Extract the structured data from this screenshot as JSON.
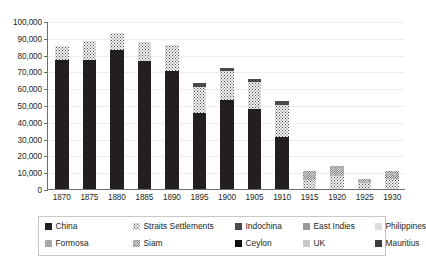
{
  "chart_data": {
    "type": "bar",
    "stacked": true,
    "title": "",
    "subtitle": "",
    "xlabel": "",
    "ylabel": "",
    "ylim": [
      0,
      100000
    ],
    "ytick_values": [
      0,
      10000,
      20000,
      30000,
      40000,
      50000,
      60000,
      70000,
      80000,
      90000,
      100000
    ],
    "ytick_labels": [
      "0",
      "10,000",
      "20,000",
      "30,000",
      "40,000",
      "50,000",
      "60,000",
      "70,000",
      "80,000",
      "90,000",
      "100,000"
    ],
    "grid": true,
    "grid_axis": "y",
    "legend_position": "bottom",
    "categories": [
      "1870",
      "1875",
      "1880",
      "1885",
      "1890",
      "1895",
      "1900",
      "1905",
      "1910",
      "1915",
      "1920",
      "1925",
      "1930"
    ],
    "series": [
      {
        "name": "China",
        "pattern": "solid-black",
        "color": "#231f20",
        "values": [
          77000,
          77000,
          83000,
          76000,
          70500,
          45000,
          53000,
          47500,
          31000,
          0,
          0,
          0,
          0
        ]
      },
      {
        "name": "Straits Settlements",
        "pattern": "light-stipple",
        "color": "#f4f4f4",
        "values": [
          8000,
          11000,
          10000,
          11500,
          15000,
          16000,
          17000,
          16000,
          19000,
          5500,
          7500,
          3500,
          6000
        ]
      },
      {
        "name": "Indochina",
        "pattern": "solid-dark-gray",
        "color": "#4a4a4a",
        "values": [
          0,
          0,
          0,
          0,
          0,
          2000,
          2000,
          2000,
          2500,
          0,
          0,
          0,
          0
        ]
      },
      {
        "name": "East Indies",
        "pattern": "solid-mid-gray",
        "color": "#9a9a9a",
        "values": [
          0,
          0,
          0,
          0,
          0,
          0,
          0,
          0,
          0,
          0,
          0,
          0,
          0
        ]
      },
      {
        "name": "Philippines",
        "pattern": "solid-very-light-gray",
        "color": "#dcdcdc",
        "values": [
          0,
          0,
          0,
          0,
          0,
          0,
          0,
          0,
          0,
          0,
          0,
          0,
          0
        ]
      },
      {
        "name": "Formosa",
        "pattern": "solid-light-gray",
        "color": "#a8a8a8",
        "values": [
          0,
          0,
          0,
          0,
          0,
          0,
          0,
          0,
          0,
          0,
          0,
          0,
          0
        ]
      },
      {
        "name": "Siam",
        "pattern": "dense-checker",
        "color": "#e8e8e8",
        "values": [
          0,
          0,
          0,
          0,
          0,
          0,
          0,
          0,
          0,
          5000,
          6500,
          2500,
          5000
        ]
      },
      {
        "name": "Ceylon",
        "pattern": "solid-black",
        "color": "#0f0d0e",
        "values": [
          0,
          0,
          0,
          0,
          0,
          0,
          0,
          0,
          0,
          0,
          0,
          0,
          0
        ]
      },
      {
        "name": "UK",
        "pattern": "solid-light-gray",
        "color": "#c8c8c8",
        "values": [
          0,
          0,
          0,
          0,
          0,
          0,
          0,
          0,
          0,
          0,
          0,
          0,
          0
        ]
      },
      {
        "name": "Mauritius",
        "pattern": "solid-dark-gray",
        "color": "#3c3c3c",
        "values": [
          0,
          0,
          0,
          0,
          0,
          0,
          0,
          0,
          0,
          0,
          0,
          0,
          0
        ]
      }
    ],
    "totals": [
      85000,
      88000,
      93000,
      87500,
      85500,
      63000,
      72000,
      65500,
      52500,
      10500,
      14000,
      6000,
      11000
    ]
  },
  "legend": {
    "rows": [
      [
        {
          "label": "China",
          "fill": "f-china"
        },
        {
          "label": "Straits Settlements",
          "fill": "f-straits"
        },
        {
          "label": "Indochina",
          "fill": "f-indochina"
        },
        {
          "label": "East Indies",
          "fill": "f-eastindies"
        },
        {
          "label": "Philippines",
          "fill": "f-philippines"
        }
      ],
      [
        {
          "label": "Formosa",
          "fill": "f-formosa"
        },
        {
          "label": "Siam",
          "fill": "f-siam"
        },
        {
          "label": "Ceylon",
          "fill": "f-ceylon"
        },
        {
          "label": "UK",
          "fill": "f-uk"
        },
        {
          "label": "Mauritius",
          "fill": "f-mauritius"
        }
      ]
    ]
  }
}
